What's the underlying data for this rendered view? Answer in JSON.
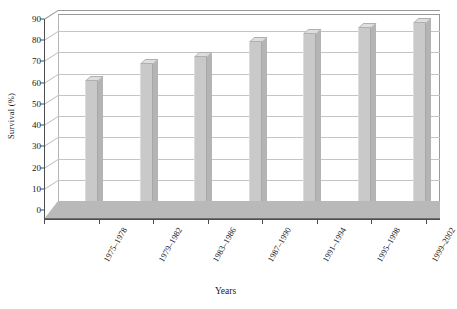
{
  "chart_data": {
    "type": "bar",
    "title": "",
    "subtitle": "",
    "xlabel": "Years",
    "ylabel": "Survival (%)",
    "categories": [
      "1975–1978",
      "1979–1982",
      "1983–1986",
      "1987–1990",
      "1991–1994",
      "1995–1998",
      "1999–2002"
    ],
    "values": [
      61,
      69,
      72,
      79,
      83,
      86,
      88
    ],
    "series": [
      {
        "name": "Survival",
        "values": [
          61,
          69,
          72,
          79,
          83,
          86,
          88
        ]
      }
    ],
    "ylim": [
      0,
      90
    ],
    "ytick_labels": [
      "0",
      "10",
      "20",
      "30",
      "40",
      "50",
      "60",
      "70",
      "80",
      "90"
    ],
    "ytick_values": [
      0,
      10,
      20,
      30,
      40,
      50,
      60,
      70,
      80,
      90
    ],
    "grid": true,
    "grid_axis": "y",
    "legend": false,
    "legend_position": "none",
    "style": "3d-column",
    "colors": {
      "bar_front": "#c9c9c9",
      "bar_top": "#dedede",
      "bar_side": "#b4b4b4",
      "gridline": "#c4c4c4",
      "axis": "#4d4d4d",
      "floor": "#b9b9b9",
      "background": "#ffffff",
      "text": "#1a1a1a"
    }
  }
}
